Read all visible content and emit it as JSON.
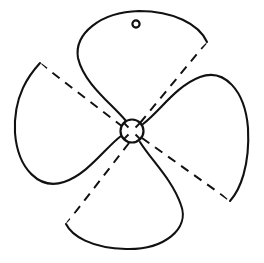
{
  "drawing": {
    "title": "Four-blade propeller outline",
    "subject": "propeller",
    "background_color": "#ffffff",
    "line_color": "#111111",
    "line_width_px": 2,
    "canvas": {
      "width": 264,
      "height": 263
    },
    "hub": {
      "label": "hub",
      "center_x": 132,
      "center_y": 131,
      "radius": 11.5,
      "tick_count": 4,
      "tick_inner_radius": 5,
      "tick_outer_radius": 11.5,
      "tick_angles_deg": [
        45,
        135,
        225,
        315
      ]
    },
    "bolt_hole": {
      "label": "bolt-hole",
      "center_x": 136,
      "center_y": 24,
      "radius": 3.6
    },
    "blade_count": 4,
    "blades": [
      {
        "name": "blade-top",
        "label": "Top blade",
        "tip_x": 140,
        "tip_y": 12,
        "leading_corner_x": 207,
        "leading_corner_y": 42,
        "trailing_corner_x": 77,
        "trailing_corner_y": 50,
        "path": "M 126 121 C 112 104 84 84 78 58 C 74 34 100 12 139 11 C 173 11 199 24 207 42"
      },
      {
        "name": "blade-right",
        "label": "Right blade",
        "tip_x": 248,
        "tip_y": 130,
        "leading_corner_x": 230,
        "leading_corner_y": 201,
        "trailing_corner_x": 193,
        "trailing_corner_y": 74,
        "path": "M 143 124 C 160 111 176 86 200 77 C 224 68 245 90 248 128 C 250 166 240 190 230 201"
      },
      {
        "name": "blade-bottom",
        "label": "Bottom blade",
        "tip_x": 126,
        "tip_y": 249,
        "leading_corner_x": 66,
        "leading_corner_y": 224,
        "trailing_corner_x": 190,
        "trailing_corner_y": 207,
        "path": "M 140 142 C 151 160 172 179 181 205 C 190 229 164 250 126 249 C 91 248 72 236 66 224"
      },
      {
        "name": "blade-left",
        "label": "Left blade",
        "tip_x": 15,
        "tip_y": 133,
        "leading_corner_x": 40,
        "leading_corner_y": 63,
        "trailing_corner_x": 74,
        "trailing_corner_y": 188,
        "path": "M 121 136 C 105 148 88 174 64 182 C 40 190 18 170 15 133 C 13 95 30 74 40 63"
      }
    ],
    "pitch_lines": [
      {
        "name": "pitch-line-top-right",
        "from_x": 140,
        "from_y": 123,
        "to_x": 206,
        "to_y": 43
      },
      {
        "name": "pitch-line-left",
        "from_x": 123,
        "from_y": 127,
        "to_x": 41,
        "to_y": 64
      },
      {
        "name": "pitch-line-bottom-right",
        "from_x": 142,
        "from_y": 138,
        "to_x": 229,
        "to_y": 200
      },
      {
        "name": "pitch-line-bottom-left",
        "from_x": 129,
        "from_y": 143,
        "to_x": 67,
        "to_y": 223
      }
    ]
  }
}
